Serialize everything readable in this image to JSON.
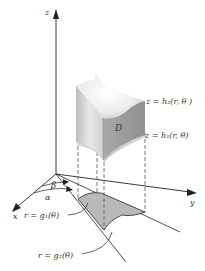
{
  "figure": {
    "type": "3d-region-cylindrical-coordinates",
    "axes": {
      "z_label": "z",
      "x_label": "x",
      "y_label": "y"
    },
    "angles": {
      "alpha_label": "α",
      "beta_label": "β"
    },
    "surfaces": {
      "upper_label": "z = h₂(r, θ )",
      "lower_label": "z = h₁(r, θ)",
      "solid_label": "D"
    },
    "curves": {
      "inner_label": "r = g₁(θ)",
      "outer_label": "r = g₂(θ)"
    },
    "colors": {
      "axis": "#222222",
      "solid_light": "#f2f2f2",
      "solid_mid": "#cfcfcf",
      "solid_dark": "#a8a8a8",
      "region_fill": "#b9b9b9",
      "dashed": "#555555",
      "label": "#333333"
    }
  }
}
